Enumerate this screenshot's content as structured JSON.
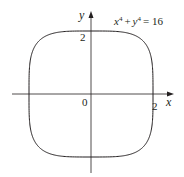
{
  "chart_data": {
    "type": "line",
    "title": "",
    "equation": {
      "base_x": "x",
      "exp_x": "4",
      "plus": "+",
      "base_y": "y",
      "exp_y": "4",
      "rhs": "= 16"
    },
    "xlabel": "x",
    "ylabel": "y",
    "origin_label": "0",
    "x_tick_labels": [
      "2"
    ],
    "y_tick_labels": [
      "2"
    ],
    "xlim": [
      -2.4,
      2.6
    ],
    "ylim": [
      -2.6,
      2.6
    ],
    "grid": false,
    "legend": "none",
    "series": [
      {
        "name": "x^4 + y^4 = 16",
        "curve": "superellipse",
        "exponent": 4,
        "radius": 2
      }
    ]
  },
  "colors": {
    "curve": "#231f20",
    "axes": "#231f20"
  }
}
